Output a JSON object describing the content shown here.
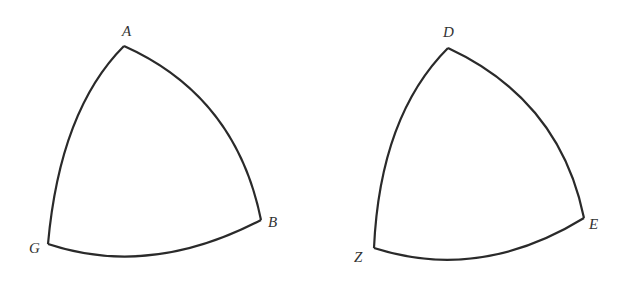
{
  "figure": {
    "stroke_color": "#2a2a2a",
    "label_color": "#333333"
  },
  "triangles": [
    {
      "name": "ABG",
      "vertices": [
        {
          "label": "A",
          "x": 124,
          "y": 46,
          "label_x": 122,
          "label_y": 36
        },
        {
          "label": "B",
          "x": 261,
          "y": 220,
          "label_x": 268,
          "label_y": 227
        },
        {
          "label": "G",
          "x": 48,
          "y": 244,
          "label_x": 29,
          "label_y": 253
        }
      ]
    },
    {
      "name": "DEZ",
      "vertices": [
        {
          "label": "D",
          "x": 448,
          "y": 48,
          "label_x": 443,
          "label_y": 37
        },
        {
          "label": "E",
          "x": 584,
          "y": 218,
          "label_x": 589,
          "label_y": 229
        },
        {
          "label": "Z",
          "x": 374,
          "y": 248,
          "label_x": 354,
          "label_y": 262
        }
      ]
    }
  ]
}
